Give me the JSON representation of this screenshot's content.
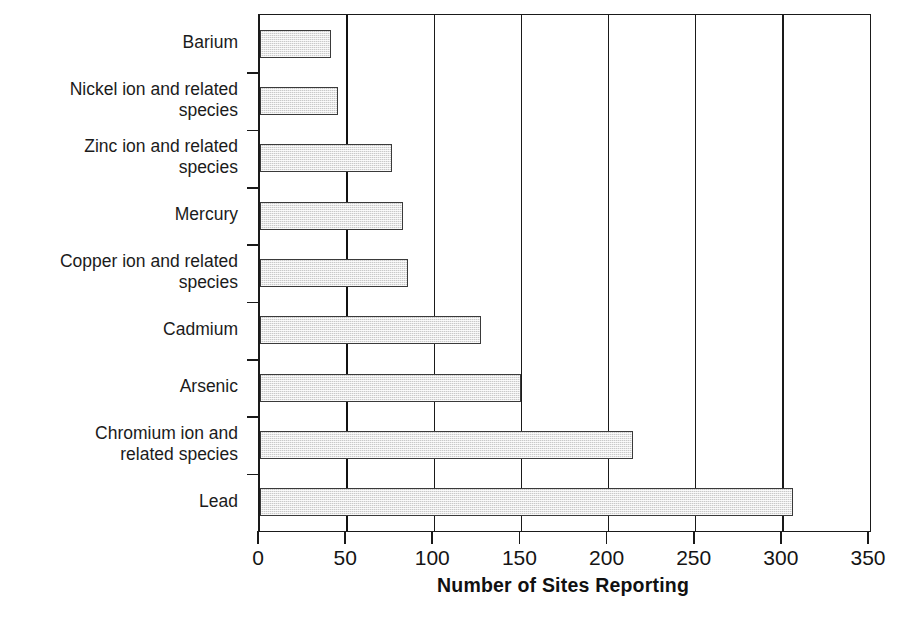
{
  "chart_data": {
    "type": "bar",
    "orientation": "horizontal",
    "title": "",
    "xlabel": "Number of Sites Reporting",
    "ylabel": "",
    "xlim": [
      0,
      350
    ],
    "xticks": [
      0,
      50,
      100,
      150,
      200,
      250,
      300,
      350
    ],
    "xticklabels": [
      "0",
      "50",
      "100",
      "150",
      "200",
      "250",
      "300",
      "350"
    ],
    "grid": "vertical",
    "legend": "none",
    "bar_fill_color": "#c9c9c9",
    "bar_edge_color": "#3a3a3a",
    "axis_color": "#1a1a1a",
    "categories": [
      "Barium",
      "Nickel ion and related\nspecies",
      "Zinc ion and related\nspecies",
      "Mercury",
      "Copper ion and related\nspecies",
      "Cadmium",
      "Arsenic",
      "Chromium ion and\nrelated species",
      "Lead"
    ],
    "values": [
      41,
      45,
      76,
      82,
      85,
      127,
      150,
      214,
      306
    ]
  }
}
